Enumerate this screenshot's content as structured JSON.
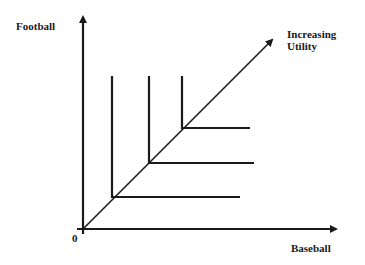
{
  "diagram": {
    "x_axis_label": "Baseball",
    "y_axis_label": "Football",
    "origin_label": "0",
    "direction_label_line1": "Increasing",
    "direction_label_line2": "Utility",
    "curve_count": 3,
    "curve_shape": "L-shaped (perfect complements)",
    "line_color": "#1a1a1a"
  }
}
